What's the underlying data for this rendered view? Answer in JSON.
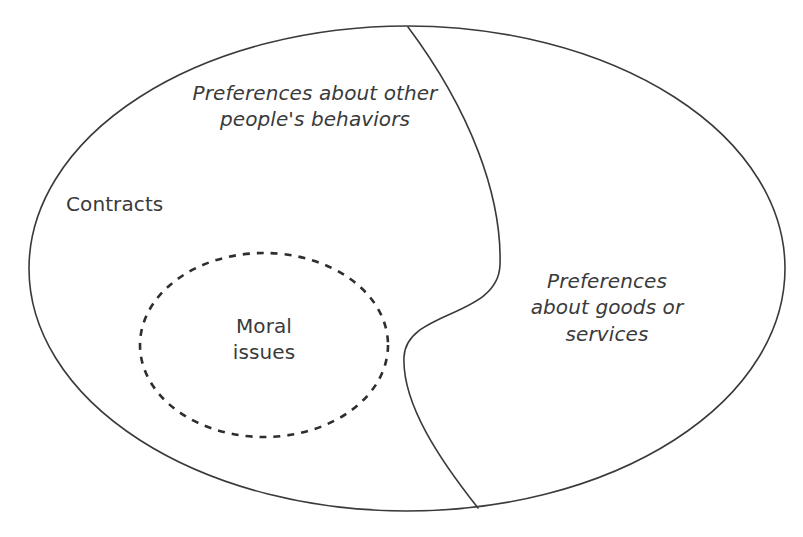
{
  "diagram": {
    "type": "venn-style conceptual diagram",
    "background_color": "#ffffff",
    "stroke_color": "#3a3a3a",
    "text_color": "#3a3a3a",
    "regions": [
      {
        "id": "other-behaviors",
        "label": "Preferences about other\npeople's behaviors",
        "style": "italic"
      },
      {
        "id": "goods-services",
        "label": "Preferences\nabout goods or\nservices",
        "style": "italic"
      },
      {
        "id": "contracts",
        "label": "Contracts",
        "style": "plain"
      },
      {
        "id": "moral-issues",
        "label": "Moral\nissues",
        "style": "plain"
      }
    ],
    "shapes": {
      "outer_ellipse": {
        "name": "outer-ellipse",
        "cx": 407,
        "cy": 268.5,
        "rx": 378,
        "ry": 242.5,
        "stroke": "#3a3a3a",
        "stroke_width": 1.6,
        "dashed": false
      },
      "dashed_ellipse": {
        "name": "moral-issues-ellipse",
        "cx": 264,
        "cy": 345,
        "rx": 124,
        "ry": 92,
        "stroke": "#2e2e2e",
        "stroke_width": 2.6,
        "dashed": true,
        "dash_pattern": "7 7"
      },
      "divider_curve": {
        "name": "divider-curve",
        "path": "M 408 27 C 470 110 502 195 500 265 C 498 318 406 310 404 357 C 402 404 440 460 478 508",
        "stroke": "#3a3a3a",
        "stroke_width": 1.6,
        "dashed": false
      }
    }
  }
}
